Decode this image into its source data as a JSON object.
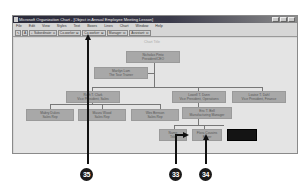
{
  "window": {
    "title": "Microsoft Organization Chart - [Object in Annual Employee Meeting Lesson]",
    "controls": [
      "minimize",
      "maximize",
      "close"
    ]
  },
  "menu": [
    "File",
    "Edit",
    "View",
    "Styles",
    "Text",
    "Boxes",
    "Lines",
    "Chart",
    "Window",
    "Help"
  ],
  "toolbar": {
    "select_icon": "arrow-pointer-icon",
    "text_icon": "A",
    "zoom_icon": "magnifier-icon",
    "buttons": [
      "Subordinate: ",
      "Co-worker: ",
      "Co-worker: ",
      "Manager: ",
      "Assistant: "
    ]
  },
  "chart": {
    "title": "Chart Title",
    "boxes": [
      {
        "id": "top",
        "name": "Nicholas Pinto",
        "title": "President/CEO"
      },
      {
        "id": "assistant",
        "name": "Marilyn Lam",
        "title": "The Tour Trainer"
      },
      {
        "id": "vp-sales",
        "name": "Ruth T. Clark",
        "title": "Vice President, Sales"
      },
      {
        "id": "vp-ops",
        "name": "Lowell T. Dunn",
        "title": "Vice President, Operations"
      },
      {
        "id": "vp-finance",
        "name": "Louise T. Dahl",
        "title": "Vice President, Finance"
      },
      {
        "id": "rep1",
        "name": "Mabry Dukes",
        "title": "Sales Rep"
      },
      {
        "id": "rep2",
        "name": "Maura Wood",
        "title": "Sales Rep"
      },
      {
        "id": "rep3",
        "name": "Wes Benson",
        "title": "Sales Rep"
      },
      {
        "id": "mfg",
        "name": "Eric T. Bell",
        "title": "Manufacturing Manager"
      },
      {
        "id": "sub1",
        "name": "Name",
        "title": "Title"
      },
      {
        "id": "sub2",
        "name": "Flora Cousins",
        "title": "Buyer"
      },
      {
        "id": "sub3",
        "name": "",
        "title": ""
      }
    ]
  },
  "callouts": [
    "35",
    "33",
    "34"
  ]
}
